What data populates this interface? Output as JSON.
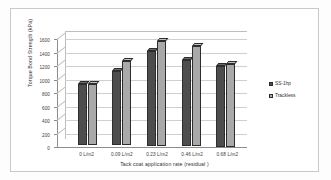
{
  "chart_data": {
    "type": "bar",
    "title": "",
    "xlabel": "Tack coat application rate (residual )",
    "ylabel": "Torque Bond Strength (kPa)",
    "categories": [
      "0 L/m2",
      "0.09 L/m2",
      "0.23 L/m2",
      "0.46 L/m2",
      "0.68 L/m2"
    ],
    "series": [
      {
        "name": "SS-1hp",
        "color": "#4d4d4d",
        "values": [
          900,
          1100,
          1400,
          1270,
          1190
        ]
      },
      {
        "name": "Trackless",
        "color": "#a9a9a9",
        "values": [
          900,
          1250,
          1550,
          1480,
          1230
        ]
      }
    ],
    "ylim": [
      0,
      1600
    ],
    "yticks": [
      0,
      200,
      400,
      600,
      800,
      1000,
      1200,
      1400,
      1600
    ],
    "grid": true,
    "legend_position": "right",
    "style_3d": true
  },
  "legend": {
    "items": [
      {
        "label": "SS-1hp",
        "swatch": "#4d4d4d"
      },
      {
        "label": "Trackless",
        "swatch": "#a9a9a9"
      }
    ]
  }
}
